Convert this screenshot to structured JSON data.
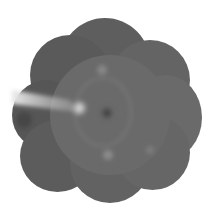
{
  "image": {
    "subject": "wide-field retinal fundus montage (grayscale)",
    "background_color": "#ffffff",
    "tone_dark": "#3c3c3c",
    "tone_mid": "#6a6a6a",
    "tone_light": "#d8d8d8",
    "features": {
      "optic_disc": {
        "x": 78,
        "y": 108
      },
      "macula_fovea": {
        "x": 107,
        "y": 113
      },
      "hyperfluorescent_streak": {
        "from": [
          12,
          95
        ],
        "to": [
          80,
          108
        ]
      }
    }
  }
}
